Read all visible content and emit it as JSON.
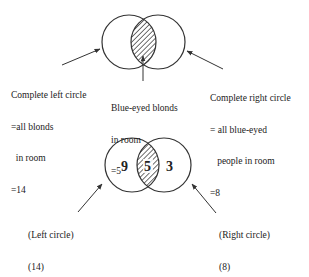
{
  "diagram_top": {
    "left_label": [
      "Complete left circle",
      "=all blonds",
      "  in room",
      "=14"
    ],
    "middle_label": [
      "Blue-eyed blonds",
      "in room",
      "=5"
    ],
    "right_label": [
      "Complete right circle",
      "= all blue-eyed",
      "   people in room",
      "=8"
    ]
  },
  "diagram_bottom": {
    "left_only": "9",
    "intersection": "5",
    "right_only": "3",
    "left_label": [
      "(Left circle)",
      "(14)"
    ],
    "right_label": [
      "(Right circle)",
      "(8)"
    ]
  },
  "colors": {
    "stroke": "#333333",
    "background": "#ffffff"
  }
}
